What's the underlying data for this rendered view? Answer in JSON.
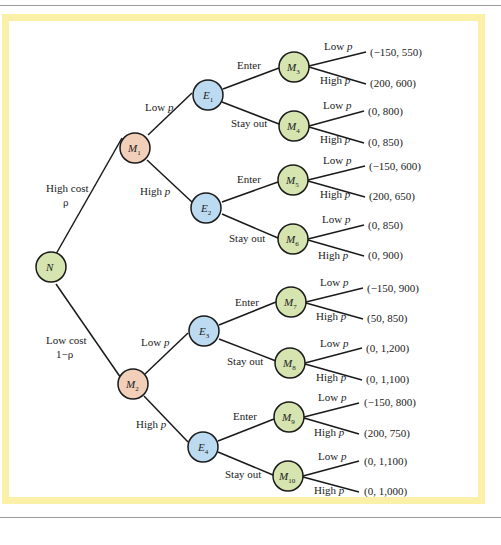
{
  "colors": {
    "frame": "#fbf0a8",
    "nature_node": "#d6e4b0",
    "monopolist_node": "#f2cfb8",
    "entrant_node": "#bcdaf0",
    "stage3_node": "#d6e4b0",
    "edge": "#1a1a1a"
  },
  "nodes": {
    "N": {
      "label": "N",
      "sub": ""
    },
    "M1": {
      "label": "M",
      "sub": "1"
    },
    "M2": {
      "label": "M",
      "sub": "2"
    },
    "E1": {
      "label": "E",
      "sub": "1"
    },
    "E2": {
      "label": "E",
      "sub": "2"
    },
    "E3": {
      "label": "E",
      "sub": "3"
    },
    "E4": {
      "label": "E",
      "sub": "4"
    },
    "M3": {
      "label": "M",
      "sub": "3"
    },
    "M4": {
      "label": "M",
      "sub": "4"
    },
    "M5": {
      "label": "M",
      "sub": "5"
    },
    "M6": {
      "label": "M",
      "sub": "6"
    },
    "M7": {
      "label": "M",
      "sub": "7"
    },
    "M8": {
      "label": "M",
      "sub": "8"
    },
    "M9": {
      "label": "M",
      "sub": "9"
    },
    "M10": {
      "label": "M",
      "sub": "10"
    }
  },
  "nature_branches": {
    "high": {
      "line1": "High cost",
      "line2": "ρ"
    },
    "low": {
      "line1": "Low cost",
      "line2": "1−ρ"
    }
  },
  "price_labels": {
    "low": "Low p",
    "high": "High p"
  },
  "entry_labels": {
    "enter": "Enter",
    "stay_out": "Stay out"
  },
  "payoffs": {
    "M3": {
      "low": "(−150, 550)",
      "high": "(200, 600)"
    },
    "M4": {
      "low": "(0, 800)",
      "high": "(0, 850)"
    },
    "M5": {
      "low": "(−150, 600)",
      "high": "(200, 650)"
    },
    "M6": {
      "low": "(0, 850)",
      "high": "(0, 900)"
    },
    "M7": {
      "low": "(−150, 900)",
      "high": "(50, 850)"
    },
    "M8": {
      "low": "(0, 1,200)",
      "high": "(0, 1,100)"
    },
    "M9": {
      "low": "(−150, 800)",
      "high": "(200, 750)"
    },
    "M10": {
      "low": "(0, 1,100)",
      "high": "(0, 1,000)"
    }
  }
}
